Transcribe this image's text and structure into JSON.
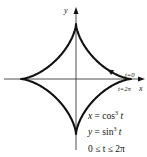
{
  "diagram": {
    "type": "parametric-curve",
    "name": "astroid",
    "axes": {
      "x_label": "x",
      "y_label": "y"
    },
    "curve": {
      "x_expr": "cos^3 t",
      "y_expr": "sin^3 t",
      "t_range": [
        0,
        6.283185307179586
      ],
      "direction": "counterclockwise"
    },
    "point_labels": {
      "start": "t=0",
      "end": "t=2π"
    },
    "equations": {
      "x_lhs": "x = cos",
      "x_exp": "3",
      "x_var": " t",
      "y_lhs": "y = sin",
      "y_exp": "3",
      "y_var": " t",
      "range": "0 ≤ t ≤ 2π"
    }
  }
}
